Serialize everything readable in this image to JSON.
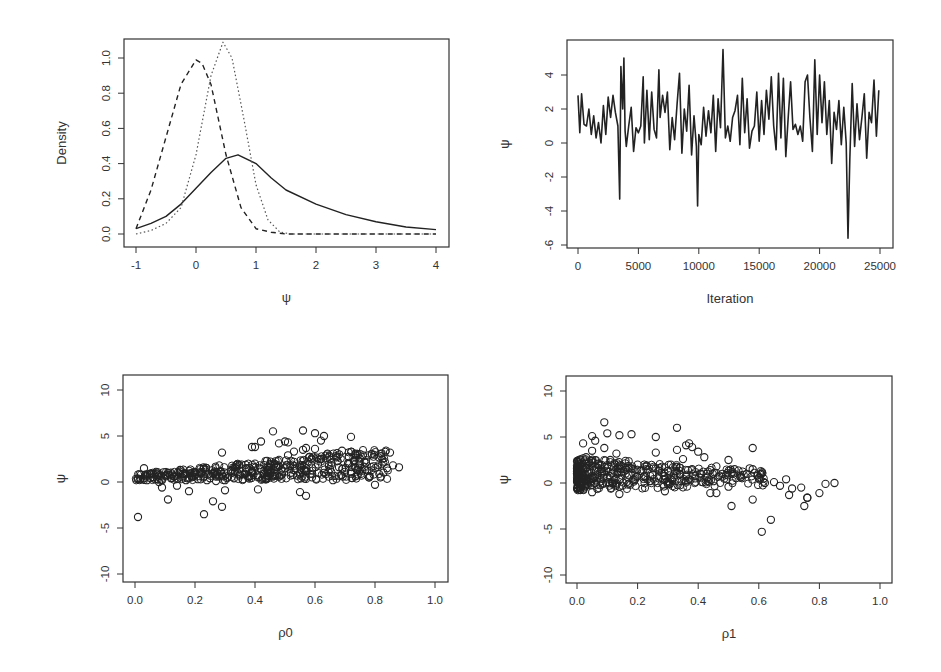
{
  "figure": {
    "panels": [
      {
        "id": "density",
        "xlabel": "ψ",
        "ylabel": "Density"
      },
      {
        "id": "trace",
        "xlabel": "Iteration",
        "ylabel": "ψ"
      },
      {
        "id": "scatter-rho0",
        "xlabel": "ρ0",
        "ylabel": "ψ"
      },
      {
        "id": "scatter-rho1",
        "xlabel": "ρ1",
        "ylabel": "ψ"
      }
    ]
  },
  "chart_data": [
    {
      "type": "line",
      "title": "",
      "xlabel": "ψ",
      "ylabel": "Density",
      "xlim": [
        -1,
        4
      ],
      "ylim": [
        0,
        1.1
      ],
      "xticks": [
        "-1",
        "0",
        "1",
        "2",
        "3",
        "4"
      ],
      "yticks": [
        "0.0",
        "0.2",
        "0.4",
        "0.6",
        "0.8",
        "1.0"
      ],
      "grid": false,
      "legend": null,
      "series": [
        {
          "name": "solid",
          "style": "solid",
          "x": [
            -1,
            -0.75,
            -0.5,
            -0.25,
            0,
            0.25,
            0.5,
            0.7,
            1.0,
            1.25,
            1.5,
            2.0,
            2.5,
            3.0,
            3.5,
            4.0
          ],
          "values": [
            0.03,
            0.06,
            0.1,
            0.17,
            0.26,
            0.35,
            0.43,
            0.45,
            0.4,
            0.32,
            0.25,
            0.17,
            0.11,
            0.07,
            0.04,
            0.025
          ]
        },
        {
          "name": "dashed",
          "style": "dashed",
          "x": [
            -1,
            -0.75,
            -0.5,
            -0.25,
            0,
            0.1,
            0.25,
            0.5,
            0.75,
            1.0,
            1.25,
            1.5,
            2,
            3,
            4
          ],
          "values": [
            0.03,
            0.25,
            0.55,
            0.85,
            0.99,
            0.97,
            0.85,
            0.45,
            0.15,
            0.03,
            0.01,
            0.0,
            0.0,
            0.0,
            0.0
          ]
        },
        {
          "name": "dotted",
          "style": "dotted",
          "x": [
            -1,
            -0.75,
            -0.5,
            -0.25,
            0,
            0.25,
            0.45,
            0.6,
            0.8,
            1.0,
            1.2,
            1.4,
            1.6,
            2,
            4
          ],
          "values": [
            0.0,
            0.02,
            0.06,
            0.15,
            0.45,
            0.9,
            1.09,
            1.0,
            0.65,
            0.28,
            0.08,
            0.01,
            0.0,
            0.0,
            0.0
          ]
        }
      ]
    },
    {
      "type": "line",
      "title": "",
      "xlabel": "Iteration",
      "ylabel": "ψ",
      "xlim": [
        0,
        25000
      ],
      "ylim": [
        -6,
        5.5
      ],
      "xticks": [
        "0",
        "5000",
        "10000",
        "15000",
        "20000",
        "25000"
      ],
      "yticks": [
        "-6",
        "-4",
        "-2",
        "0",
        "2",
        "4"
      ],
      "grid": false,
      "series": [
        {
          "name": "ψ trace",
          "x": [
            0,
            150,
            300,
            500,
            700,
            900,
            1100,
            1300,
            1500,
            1700,
            1900,
            2100,
            2300,
            2500,
            2700,
            2900,
            3100,
            3300,
            3450,
            3550,
            3700,
            3800,
            3900,
            4000,
            4200,
            4400,
            4600,
            4800,
            5000,
            5200,
            5400,
            5500,
            5700,
            5900,
            6100,
            6300,
            6500,
            6700,
            6800,
            7000,
            7200,
            7400,
            7600,
            7800,
            8000,
            8200,
            8400,
            8600,
            8800,
            9000,
            9200,
            9400,
            9600,
            9800,
            9900,
            10000,
            10200,
            10400,
            10600,
            10800,
            11000,
            11200,
            11400,
            11600,
            11800,
            12000,
            12200,
            12400,
            12600,
            12800,
            13000,
            13200,
            13400,
            13600,
            13800,
            14000,
            14200,
            14400,
            14600,
            14800,
            15000,
            15200,
            15400,
            15600,
            15800,
            16000,
            16200,
            16400,
            16600,
            16800,
            17000,
            17200,
            17400,
            17600,
            17800,
            18000,
            18200,
            18400,
            18600,
            18800,
            19000,
            19200,
            19400,
            19600,
            19800,
            20000,
            20200,
            20400,
            20600,
            20800,
            21000,
            21200,
            21400,
            21600,
            21800,
            22000,
            22200,
            22350,
            22500,
            22700,
            22900,
            23100,
            23300,
            23500,
            23700,
            23900,
            24100,
            24300,
            24500,
            24700,
            24900
          ],
          "values": [
            2.8,
            0.6,
            2.9,
            1.1,
            1.0,
            2.0,
            0.5,
            1.6,
            0.3,
            1.2,
            0.0,
            2.2,
            0.5,
            2.7,
            1.5,
            2.8,
            1.8,
            1.0,
            -3.3,
            4.5,
            2.0,
            5.0,
            0.7,
            -0.2,
            1.0,
            2.1,
            -0.5,
            0.9,
            0.6,
            1.0,
            3.9,
            0.0,
            3.1,
            0.2,
            3.0,
            0.8,
            0.3,
            4.3,
            1.5,
            2.8,
            1.8,
            3.0,
            -0.4,
            1.5,
            0.2,
            2.3,
            4.1,
            -0.6,
            2.0,
            0.7,
            3.4,
            -0.7,
            1.6,
            -0.2,
            -3.7,
            0.5,
            -0.1,
            2.1,
            0.4,
            1.9,
            0.6,
            2.8,
            -0.5,
            2.6,
            0.9,
            5.5,
            0.3,
            1.0,
            0.1,
            1.5,
            1.9,
            2.8,
            -0.1,
            3.8,
            0.6,
            2.6,
            -0.3,
            0.7,
            1.0,
            3.0,
            0.1,
            2.5,
            0.5,
            3.1,
            1.4,
            3.9,
            1.0,
            -0.4,
            4.1,
            0.3,
            3.8,
            -0.8,
            1.5,
            3.6,
            0.8,
            1.1,
            0.5,
            1.0,
            0.1,
            3.6,
            4.0,
            1.5,
            -0.5,
            4.9,
            0.5,
            4.0,
            1.2,
            3.6,
            0.5,
            2.5,
            -1.2,
            1.8,
            0.8,
            2.5,
            -0.1,
            2.1,
            0.0,
            -5.6,
            -1.0,
            3.5,
            -0.2,
            2.3,
            0.2,
            1.5,
            2.9,
            -0.9,
            1.8,
            1.2,
            3.7,
            0.4,
            3.1,
            0.9,
            0.8
          ]
        }
      ]
    },
    {
      "type": "scatter",
      "title": "",
      "xlabel": "ρ0",
      "ylabel": "ψ",
      "xlim": [
        0,
        1
      ],
      "ylim": [
        -10,
        10
      ],
      "xticks": [
        "0.0",
        "0.2",
        "0.4",
        "0.6",
        "0.8",
        "1.0"
      ],
      "yticks": [
        "-10",
        "-5",
        "0",
        "5",
        "10"
      ],
      "grid": false,
      "marker": "open-circle",
      "x": [
        0.01,
        0.02,
        0.03,
        0.04,
        0.05,
        0.06,
        0.07,
        0.08,
        0.09,
        0.1,
        0.11,
        0.12,
        0.13,
        0.14,
        0.15,
        0.16,
        0.17,
        0.18,
        0.19,
        0.2,
        0.21,
        0.22,
        0.23,
        0.24,
        0.25,
        0.26,
        0.27,
        0.28,
        0.29,
        0.3,
        0.31,
        0.32,
        0.33,
        0.34,
        0.35,
        0.36,
        0.37,
        0.38,
        0.39,
        0.4,
        0.41,
        0.42,
        0.43,
        0.44,
        0.45,
        0.46,
        0.47,
        0.48,
        0.49,
        0.5,
        0.51,
        0.52,
        0.53,
        0.54,
        0.55,
        0.56,
        0.57,
        0.58,
        0.59,
        0.6,
        0.61,
        0.62,
        0.63,
        0.64,
        0.65,
        0.66,
        0.67,
        0.68,
        0.69,
        0.7,
        0.71,
        0.72,
        0.73,
        0.74,
        0.75,
        0.76,
        0.77,
        0.78,
        0.79,
        0.8,
        0.82,
        0.84,
        0.85,
        0.86,
        0.88,
        0.01,
        0.11,
        0.23,
        0.26,
        0.29,
        0.3,
        0.39,
        0.4,
        0.42,
        0.46,
        0.48,
        0.5,
        0.51,
        0.53,
        0.56,
        0.57,
        0.6,
        0.62,
        0.63,
        0.72,
        0.29,
        0.41,
        0.18,
        0.55,
        0.57
      ],
      "y": [
        0.3,
        0.8,
        1.5,
        0.2,
        0.9,
        0.5,
        1.1,
        0.0,
        -0.6,
        0.7,
        1.0,
        0.4,
        0.6,
        -0.4,
        1.3,
        0.9,
        0.2,
        0.5,
        0.7,
        0.8,
        0.3,
        1.0,
        0.6,
        0.2,
        0.4,
        0.9,
        0.1,
        0.6,
        0.7,
        0.2,
        0.5,
        1.2,
        0.4,
        1.9,
        0.8,
        0.3,
        1.5,
        0.6,
        1.0,
        2.0,
        0.5,
        1.4,
        0.9,
        2.3,
        1.1,
        0.6,
        1.7,
        2.4,
        0.8,
        1.5,
        2.9,
        1.0,
        2.2,
        0.7,
        1.8,
        3.5,
        1.2,
        2.7,
        0.5,
        3.6,
        1.9,
        2.5,
        1.0,
        3.0,
        1.4,
        0.2,
        2.8,
        1.6,
        3.4,
        1.1,
        2.0,
        0.9,
        2.3,
        1.3,
        1.8,
        2.9,
        2.1,
        0.5,
        3.0,
        -0.3,
        2.8,
        1.5,
        3.2,
        1.8,
        1.6,
        -3.8,
        -1.9,
        -3.5,
        -2.1,
        -2.7,
        -0.9,
        3.8,
        3.8,
        4.4,
        5.5,
        4.2,
        4.4,
        4.3,
        3.3,
        5.6,
        3.7,
        5.3,
        4.5,
        5.0,
        4.9,
        3.2,
        -0.8,
        -1.0,
        -1.1,
        -1.5
      ],
      "note": "approximate subsample of ~110 points from a dense cloud of several hundred"
    },
    {
      "type": "scatter",
      "title": "",
      "xlabel": "ρ1",
      "ylabel": "ψ",
      "xlim": [
        0,
        1
      ],
      "ylim": [
        -10,
        10
      ],
      "xticks": [
        "0.0",
        "0.2",
        "0.4",
        "0.6",
        "0.8",
        "1.0"
      ],
      "yticks": [
        "-10",
        "-5",
        "0",
        "5",
        "10"
      ],
      "grid": false,
      "marker": "open-circle",
      "x": [
        0.0,
        0.01,
        0.02,
        0.03,
        0.04,
        0.05,
        0.06,
        0.07,
        0.08,
        0.09,
        0.1,
        0.11,
        0.12,
        0.13,
        0.14,
        0.15,
        0.16,
        0.17,
        0.18,
        0.19,
        0.2,
        0.21,
        0.22,
        0.23,
        0.24,
        0.25,
        0.26,
        0.27,
        0.28,
        0.29,
        0.3,
        0.31,
        0.32,
        0.33,
        0.34,
        0.35,
        0.36,
        0.37,
        0.38,
        0.39,
        0.4,
        0.41,
        0.42,
        0.43,
        0.44,
        0.45,
        0.46,
        0.47,
        0.48,
        0.5,
        0.52,
        0.54,
        0.56,
        0.58,
        0.6,
        0.62,
        0.65,
        0.67,
        0.69,
        0.71,
        0.74,
        0.76,
        0.8,
        0.82,
        0.85,
        0.02,
        0.05,
        0.06,
        0.09,
        0.1,
        0.14,
        0.18,
        0.26,
        0.33,
        0.36,
        0.38,
        0.58,
        0.05,
        0.14,
        0.29,
        0.44,
        0.46,
        0.51,
        0.58,
        0.61,
        0.64,
        0.7,
        0.75,
        0.76,
        0.5,
        0.57
      ],
      "y": [
        1.0,
        1.9,
        0.5,
        2.8,
        1.2,
        3.5,
        0.8,
        2.1,
        1.5,
        3.8,
        0.6,
        2.5,
        1.1,
        3.2,
        0.4,
        1.8,
        2.4,
        0.9,
        1.6,
        0.3,
        2.0,
        1.3,
        0.7,
        1.9,
        0.2,
        0.9,
        3.3,
        0.5,
        1.1,
        0.4,
        1.3,
        2.0,
        0.6,
        3.6,
        1.0,
        2.6,
        0.8,
        4.3,
        1.5,
        0.5,
        3.4,
        1.0,
        2.8,
        0.6,
        1.4,
        0.2,
        1.8,
        0.8,
        1.0,
        2.5,
        1.5,
        0.6,
        1.0,
        1.5,
        0.5,
        0.0,
        0.1,
        -0.3,
        0.4,
        -0.6,
        -0.5,
        -1.6,
        -1.1,
        -0.1,
        0.0,
        4.3,
        5.1,
        4.6,
        6.6,
        5.4,
        5.2,
        5.3,
        5.0,
        6.0,
        4.1,
        3.9,
        3.8,
        -1.0,
        -1.2,
        -0.9,
        -1.1,
        -1.1,
        -2.5,
        -1.8,
        -5.3,
        -4.0,
        -1.3,
        -2.5,
        -1.6,
        -0.4,
        1.6
      ],
      "note": "approximate subsample of ~90 points from a dense cloud of several hundred"
    }
  ]
}
